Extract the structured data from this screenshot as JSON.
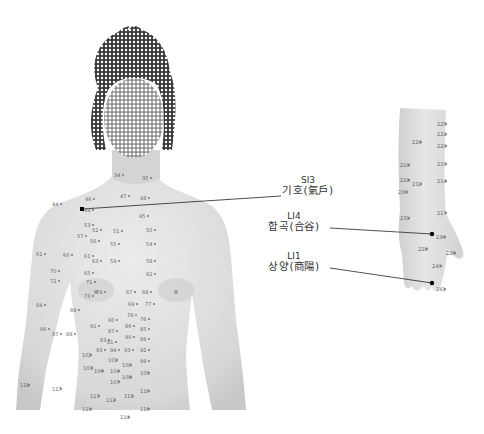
{
  "figure": {
    "callouts": [
      {
        "code": "SI3",
        "name": "기호(氣戶)"
      },
      {
        "code": "LI4",
        "name": "합곡(合谷)"
      },
      {
        "code": "LI1",
        "name": "상양(商陽)"
      }
    ],
    "torso_points": [
      {
        "n": "34",
        "x": 114,
        "y": 172
      },
      {
        "n": "35",
        "x": 142,
        "y": 175
      },
      {
        "n": "44",
        "x": 52,
        "y": 201
      },
      {
        "n": "46",
        "x": 85,
        "y": 196
      },
      {
        "n": "47",
        "x": 120,
        "y": 193
      },
      {
        "n": "48",
        "x": 140,
        "y": 195
      },
      {
        "n": "45",
        "x": 139,
        "y": 213
      },
      {
        "n": "49",
        "x": 84,
        "y": 207
      },
      {
        "n": "53",
        "x": 84,
        "y": 222
      },
      {
        "n": "52",
        "x": 92,
        "y": 227
      },
      {
        "n": "51",
        "x": 113,
        "y": 228
      },
      {
        "n": "50",
        "x": 146,
        "y": 227
      },
      {
        "n": "57",
        "x": 77,
        "y": 233
      },
      {
        "n": "56",
        "x": 90,
        "y": 238
      },
      {
        "n": "55",
        "x": 110,
        "y": 241
      },
      {
        "n": "54",
        "x": 146,
        "y": 241
      },
      {
        "n": "61",
        "x": 36,
        "y": 251
      },
      {
        "n": "60",
        "x": 63,
        "y": 252
      },
      {
        "n": "61",
        "x": 84,
        "y": 253
      },
      {
        "n": "63",
        "x": 92,
        "y": 258
      },
      {
        "n": "59",
        "x": 110,
        "y": 258
      },
      {
        "n": "58",
        "x": 146,
        "y": 258
      },
      {
        "n": "65",
        "x": 84,
        "y": 270
      },
      {
        "n": "62",
        "x": 146,
        "y": 271
      },
      {
        "n": "70",
        "x": 50,
        "y": 268
      },
      {
        "n": "72",
        "x": 50,
        "y": 278
      },
      {
        "n": "71",
        "x": 86,
        "y": 279
      },
      {
        "n": "73",
        "x": 84,
        "y": 293
      },
      {
        "n": "74",
        "x": 96,
        "y": 289
      },
      {
        "n": "67",
        "x": 126,
        "y": 289
      },
      {
        "n": "68",
        "x": 142,
        "y": 289
      },
      {
        "n": "69",
        "x": 128,
        "y": 301
      },
      {
        "n": "77",
        "x": 145,
        "y": 301
      },
      {
        "n": "84",
        "x": 36,
        "y": 302
      },
      {
        "n": "86",
        "x": 40,
        "y": 326
      },
      {
        "n": "87",
        "x": 52,
        "y": 331
      },
      {
        "n": "88",
        "x": 66,
        "y": 331
      },
      {
        "n": "89",
        "x": 70,
        "y": 307
      },
      {
        "n": "78",
        "x": 127,
        "y": 312
      },
      {
        "n": "76",
        "x": 140,
        "y": 316
      },
      {
        "n": "80",
        "x": 108,
        "y": 317
      },
      {
        "n": "86",
        "x": 125,
        "y": 323
      },
      {
        "n": "85",
        "x": 140,
        "y": 326
      },
      {
        "n": "91",
        "x": 90,
        "y": 323
      },
      {
        "n": "87",
        "x": 108,
        "y": 328
      },
      {
        "n": "83",
        "x": 100,
        "y": 337
      },
      {
        "n": "90",
        "x": 125,
        "y": 334
      },
      {
        "n": "89",
        "x": 140,
        "y": 336
      },
      {
        "n": "81",
        "x": 107,
        "y": 339
      },
      {
        "n": "93",
        "x": 96,
        "y": 347
      },
      {
        "n": "94",
        "x": 110,
        "y": 347
      },
      {
        "n": "93",
        "x": 124,
        "y": 347
      },
      {
        "n": "92",
        "x": 140,
        "y": 347
      },
      {
        "n": "101",
        "x": 108,
        "y": 357
      },
      {
        "n": "99",
        "x": 140,
        "y": 358
      },
      {
        "n": "102",
        "x": 82,
        "y": 352
      },
      {
        "n": "103",
        "x": 83,
        "y": 365
      },
      {
        "n": "100",
        "x": 122,
        "y": 362
      },
      {
        "n": "106",
        "x": 94,
        "y": 368
      },
      {
        "n": "104",
        "x": 110,
        "y": 368
      },
      {
        "n": "107",
        "x": 110,
        "y": 379
      },
      {
        "n": "108",
        "x": 122,
        "y": 374
      },
      {
        "n": "105",
        "x": 140,
        "y": 370
      },
      {
        "n": "110",
        "x": 140,
        "y": 388
      },
      {
        "n": "111",
        "x": 124,
        "y": 393
      },
      {
        "n": "112",
        "x": 106,
        "y": 397
      },
      {
        "n": "113",
        "x": 90,
        "y": 393
      },
      {
        "n": "118",
        "x": 20,
        "y": 382
      },
      {
        "n": "117",
        "x": 52,
        "y": 386
      },
      {
        "n": "119",
        "x": 82,
        "y": 406
      },
      {
        "n": "116",
        "x": 140,
        "y": 406
      },
      {
        "n": "114",
        "x": 120,
        "y": 414
      }
    ],
    "arm_points": [
      {
        "n": "225",
        "x": 437,
        "y": 121
      },
      {
        "n": "221",
        "x": 437,
        "y": 131
      },
      {
        "n": "226",
        "x": 412,
        "y": 139
      },
      {
        "n": "220",
        "x": 437,
        "y": 143
      },
      {
        "n": "215",
        "x": 437,
        "y": 161
      },
      {
        "n": "216",
        "x": 400,
        "y": 162
      },
      {
        "n": "218",
        "x": 400,
        "y": 177
      },
      {
        "n": "232",
        "x": 412,
        "y": 181
      },
      {
        "n": "214",
        "x": 437,
        "y": 178
      },
      {
        "n": "230",
        "x": 398,
        "y": 189
      },
      {
        "n": "217",
        "x": 437,
        "y": 210
      },
      {
        "n": "231",
        "x": 400,
        "y": 215
      },
      {
        "n": "236",
        "x": 436,
        "y": 234
      },
      {
        "n": "228",
        "x": 418,
        "y": 246
      },
      {
        "n": "226",
        "x": 446,
        "y": 250
      },
      {
        "n": "240",
        "x": 432,
        "y": 263
      },
      {
        "n": "241",
        "x": 436,
        "y": 286
      }
    ],
    "colors": {
      "background": "#ffffff",
      "skin": "#dcdcdc",
      "text": "#333333",
      "leader_line": "#222222"
    }
  }
}
